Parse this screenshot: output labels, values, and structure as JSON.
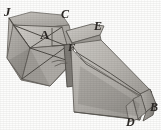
{
  "figure": {
    "background_color": "#fdfdfc",
    "ink_color": "#2a2724",
    "paper_tone_light": "#c9c6c1",
    "paper_tone_mid": "#b0ada7",
    "paper_tone_dark": "#8e8b86",
    "paper_tone_shadow": "#6d6a65",
    "labels": [
      {
        "id": "J",
        "text": "J",
        "x": 4,
        "y": 5,
        "style": "italic"
      },
      {
        "id": "C",
        "text": "C",
        "x": 61,
        "y": 8,
        "style": "italic"
      },
      {
        "id": "A",
        "text": "A",
        "x": 40,
        "y": 28,
        "style": "upright"
      },
      {
        "id": "E",
        "text": "E",
        "x": 94,
        "y": 20,
        "style": "italic"
      },
      {
        "id": "F",
        "text": "F",
        "x": 68,
        "y": 42,
        "style": "italic"
      },
      {
        "id": "B",
        "text": "B",
        "x": 150,
        "y": 101,
        "style": "italic"
      },
      {
        "id": "D",
        "text": "D",
        "x": 126,
        "y": 116,
        "style": "italic"
      }
    ],
    "parts": {
      "left_block_name": "folded square panel with diagonal creases",
      "right_block_name": "long pleated band",
      "pleat_end_name": "layered fold end"
    }
  }
}
